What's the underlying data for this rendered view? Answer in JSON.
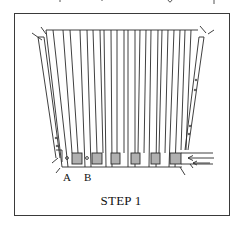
{
  "figure": {
    "caption": "STEP 1",
    "labels": {
      "a": "A",
      "b": "B"
    },
    "slat_count": 15,
    "pad_count": 6,
    "colors": {
      "line": "#2a2a2a",
      "frame": "#3a3a3a",
      "pad_fill": "#9a9a9a",
      "background": "#ffffff"
    }
  }
}
